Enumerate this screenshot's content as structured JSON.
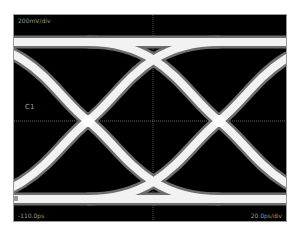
{
  "display": {
    "vertical_scale_label": "200mV/div",
    "channel_label": "C1",
    "time_offset_label": "-110.0ps",
    "horizontal_scale_label": "20.0ps/div"
  },
  "colors": {
    "background": "#000000",
    "trace": "#f2f2f2",
    "trace_glow": "#6e6e6e",
    "graticule": "#8a8a8a",
    "frame": "#9a9a9a"
  },
  "eye": {
    "crossings_x": [
      74,
      205
    ],
    "center_y": 106,
    "top_rail_y": 27,
    "bottom_rail_y": 184
  }
}
